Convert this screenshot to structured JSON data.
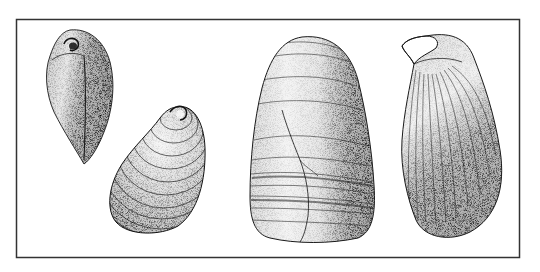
{
  "plate": {
    "description": "Engraved scientific illustration of four bivalve shells inside a rectangular frame",
    "background_color": "#ffffff",
    "ink_color": "#1a1a1a",
    "frame": {
      "x": 16,
      "y": 19,
      "width": 504,
      "height": 239,
      "stroke": "#333333",
      "stroke_width": 1.5
    }
  },
  "specimens": [
    {
      "id": "shell-1",
      "label": "Small shell, dorsal/umbonal view, teardrop shape",
      "view": "dorsal",
      "bbox": [
        45,
        30,
        90,
        135
      ]
    },
    {
      "id": "shell-2",
      "label": "Small shell, lateral view with concentric growth lines",
      "view": "lateral",
      "bbox": [
        110,
        105,
        95,
        130
      ]
    },
    {
      "id": "shell-3",
      "label": "Large fossil shell, lateral view with concentric bands and crack",
      "view": "lateral",
      "bbox": [
        250,
        35,
        115,
        205
      ]
    },
    {
      "id": "shell-4",
      "label": "Large shell, side view with radiating ribs and hooked umbo",
      "view": "profile",
      "bbox": [
        400,
        32,
        95,
        205
      ]
    }
  ]
}
